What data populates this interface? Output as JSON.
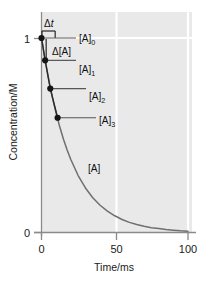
{
  "chart_data": {
    "type": "line",
    "title": "",
    "xlabel": "Time/ms",
    "ylabel": "Concentration/M",
    "xlim": [
      0,
      100
    ],
    "ylim": [
      0,
      1
    ],
    "xticks": [
      0,
      50,
      100
    ],
    "xtick_labels": [
      "0",
      "50",
      "100"
    ],
    "yticks": [
      0,
      1
    ],
    "ytick_labels": [
      "0",
      "1"
    ],
    "grid": true,
    "grid_color": "#ffffff",
    "panel_color": "#e9e9e9",
    "series": [
      {
        "name": "[A]",
        "kind": "curve",
        "color": "#6f6f6f",
        "description": "first-order exponential decay of reactant A",
        "x": [
          0,
          2.5,
          5,
          7.5,
          10,
          12.5,
          15,
          17.5,
          20,
          25,
          30,
          35,
          40,
          45,
          50,
          55,
          60,
          65,
          70,
          75,
          80,
          85,
          90,
          95,
          100
        ],
        "y": [
          1.0,
          0.885,
          0.783,
          0.692,
          0.613,
          0.542,
          0.479,
          0.424,
          0.375,
          0.293,
          0.229,
          0.179,
          0.14,
          0.11,
          0.086,
          0.067,
          0.052,
          0.041,
          0.032,
          0.025,
          0.02,
          0.015,
          0.012,
          0.009,
          0.007
        ]
      },
      {
        "name": "secant-steps",
        "kind": "markers-with-chords",
        "color": "#1a1a1a",
        "description": "four sampled concentrations joined by straight chord segments",
        "x": [
          0,
          2.5,
          6,
          11
        ],
        "y": [
          1.0,
          0.885,
          0.74,
          0.59
        ]
      }
    ],
    "point_labels": [
      "[A]0",
      "[A]1",
      "[A]2",
      "[A]3"
    ],
    "annotations": [
      {
        "name": "delta-t",
        "text": "Δt",
        "x": 3.5,
        "y": 1.09
      },
      {
        "name": "delta-A",
        "text": "Δ[A]",
        "x": 7.5,
        "y": 0.905
      },
      {
        "name": "curve-label",
        "text": "[A]",
        "x": 32,
        "y": 0.39
      }
    ]
  },
  "labels": {
    "y_tick_1": "1",
    "y_tick_0": "0",
    "x_tick_0": "0",
    "x_tick_50": "50",
    "x_tick_100": "100",
    "x_axis_title": "Time/ms",
    "y_axis_title": "Concentration/M",
    "delta_t_symbol": "Δ",
    "delta_t_var": "t",
    "delta_A_text": "Δ[A]",
    "curve_label": "[A]",
    "a0_base": "[A]",
    "a0_sub": "0",
    "a1_base": "[A]",
    "a1_sub": "1",
    "a2_base": "[A]",
    "a2_sub": "2",
    "a3_base": "[A]",
    "a3_sub": "3"
  },
  "colors": {
    "panel": "#e9e9e9",
    "grid": "#ffffff",
    "axis": "#8a8a8a",
    "curve": "#6f6f6f",
    "marker": "#151515",
    "chord": "#2a2a2a",
    "leader": "#555555",
    "text": "#1a1a1a"
  }
}
